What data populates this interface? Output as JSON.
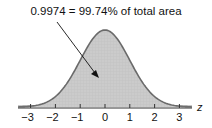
{
  "annotation": {
    "text": "0.9974 = 99.74% of total area"
  },
  "axis": {
    "variable": "z",
    "ticks": [
      "−3",
      "−2",
      "−1",
      "0",
      "1",
      "2",
      "3"
    ]
  },
  "chart_data": {
    "type": "area",
    "title": "",
    "xlabel": "z",
    "ylabel": "",
    "x_ticks": [
      -3,
      -2,
      -1,
      0,
      1,
      2,
      3
    ],
    "shaded_interval": [
      -3,
      3
    ],
    "shaded_area": 0.9974,
    "annotation": "0.9974 = 99.74% of total area"
  },
  "colors": {
    "fill": "#c9c9c9",
    "curve": "#6a6a6a",
    "axis": "#333333"
  }
}
